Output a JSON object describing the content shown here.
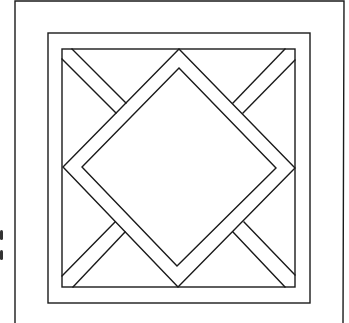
{
  "diagram": {
    "type": "geometric-line-drawing",
    "stroke_color": "#1a1a1a",
    "background_color": "#ffffff",
    "outer_frame": {
      "left": 15,
      "top": 1,
      "right": 344,
      "open_bottom": true
    },
    "middle_frame": {
      "left": 48,
      "top": 33,
      "right": 310,
      "bottom": 303
    },
    "inner_frame": {
      "left": 62,
      "top": 49,
      "right": 295,
      "bottom": 287
    },
    "diamond_outer": {
      "top": [
        179,
        49
      ],
      "right": [
        295,
        168
      ],
      "bottom": [
        178,
        287
      ],
      "left": [
        63,
        167
      ]
    },
    "diamond_inner": {
      "top": [
        179,
        68
      ],
      "right": [
        276,
        168
      ],
      "bottom": [
        177,
        266
      ],
      "left": [
        82,
        167
      ]
    },
    "corner_strips": [
      {
        "name": "top-left",
        "edges": [
          [
            [
              72,
              49
            ],
            [
              126,
              103
            ]
          ],
          [
            [
              62,
              59
            ],
            [
              116,
              113
            ]
          ]
        ]
      },
      {
        "name": "top-right",
        "edges": [
          [
            [
              285,
              49
            ],
            [
              233,
              103
            ]
          ],
          [
            [
              295,
              60
            ],
            [
              243,
              113
            ]
          ]
        ]
      },
      {
        "name": "bottom-left",
        "edges": [
          [
            [
              62,
              276
            ],
            [
              115,
              222
            ]
          ],
          [
            [
              73,
              287
            ],
            [
              125,
              232
            ]
          ]
        ]
      },
      {
        "name": "bottom-right",
        "edges": [
          [
            [
              295,
              275
            ],
            [
              244,
              222
            ]
          ],
          [
            [
              285,
              287
            ],
            [
              233,
              232
            ]
          ]
        ]
      }
    ],
    "edge_marks": [
      {
        "x": 0,
        "y": 230,
        "h": 10
      },
      {
        "x": 0,
        "y": 250,
        "h": 10
      }
    ]
  }
}
